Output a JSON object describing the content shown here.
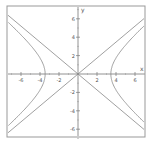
{
  "chart_data": {
    "type": "line",
    "title": "",
    "xlabel": "x",
    "ylabel": "y",
    "xlim": [
      -7.3,
      7.3
    ],
    "ylim": [
      -7.2,
      7.0
    ],
    "grid": false,
    "legend": null,
    "x_ticks": [
      -6,
      -4,
      -2,
      2,
      4,
      6
    ],
    "y_ticks": [
      6,
      4,
      2,
      -2,
      -4,
      -6
    ],
    "x_tick_labels": [
      "-6",
      "-4",
      "-2",
      "2",
      "4",
      "6"
    ],
    "y_tick_labels": [
      "6",
      "4",
      "2",
      "-2",
      "-4",
      "-6"
    ],
    "series": [
      {
        "name": "hyperbola",
        "equation": "x^2/12 - y^2/9 = 1",
        "a": 3.46,
        "b": 3,
        "color": "#888888"
      },
      {
        "name": "asymptote 1",
        "equation": "y = 0.866x",
        "color": "#888888"
      },
      {
        "name": "asymptote 2",
        "equation": "y = -0.866x",
        "color": "#888888"
      }
    ]
  }
}
